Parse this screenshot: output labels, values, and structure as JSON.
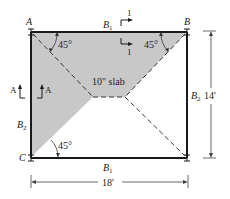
{
  "diagram": {
    "corners": {
      "A": "A",
      "B": "B",
      "C": "C"
    },
    "beams": {
      "top": {
        "label": "B",
        "sub": "1"
      },
      "bottom": {
        "label": "B",
        "sub": "1"
      },
      "left": {
        "label": "B",
        "sub": "2"
      },
      "right": {
        "label": "B",
        "sub": "2"
      }
    },
    "angles": {
      "top_left": "45°",
      "top_right": "45°",
      "bottom_left": "45°"
    },
    "slab_label": "10\" slab",
    "section_marks": {
      "section_1_label": "1",
      "section_A_label": "A"
    },
    "dimensions": {
      "height": "14'",
      "width": "18'"
    },
    "colors": {
      "shaded_area": "#c8c8c8",
      "lines": "#1a1a1a",
      "background": "#ffffff"
    }
  }
}
